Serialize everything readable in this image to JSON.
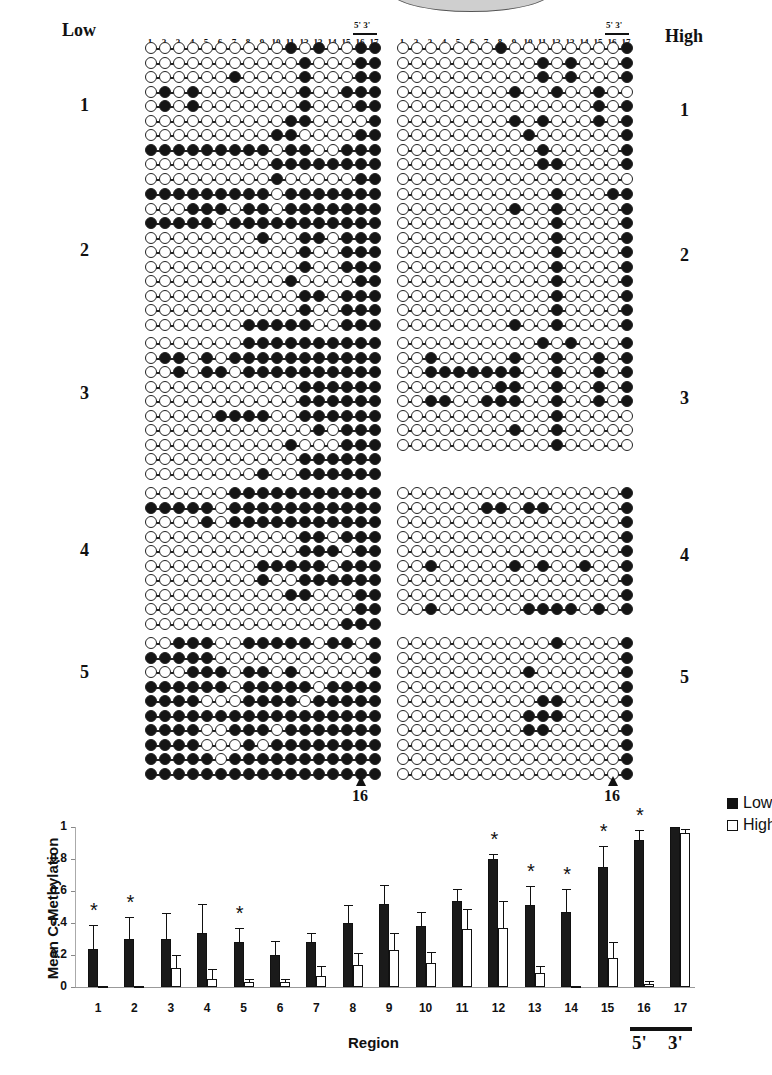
{
  "header": {
    "left_title": "Low",
    "right_title": "High",
    "primer_label": "5'  3'",
    "position_numbers": [
      "1",
      "2",
      "3",
      "4",
      "5",
      "6",
      "7",
      "8",
      "9",
      "10",
      "11",
      "12",
      "13",
      "14",
      "15",
      "16",
      "17"
    ],
    "banner_tail": "es   ng"
  },
  "groups": [
    {
      "label": "1",
      "low": [
        "00000000001010011",
        "00000000000100011",
        "00000010000100011",
        "01010000000100111",
        "01010000000100011",
        "00000000001100001",
        "00000000011000011",
        "11111111101100111",
        "00000000011111111",
        "00000000010000011"
      ],
      "high": [
        "00000001000000001",
        "00000000001010001",
        "00000000001010001",
        "00000000100100100",
        "00000000000000101",
        "00000000101000101",
        "00000000010000001",
        "00000000001000001",
        "00000000001100001",
        "00000000000000000"
      ]
    },
    {
      "label": "2",
      "low": [
        "11111111101111111",
        "00011101101111111",
        "11111011111111111",
        "00000000100110111",
        "00000000000100111",
        "00000000000100111",
        "00000000001000011",
        "00000000000110111",
        "00000000000100111",
        "00000001111100111"
      ],
      "high": [
        "00000000000100011",
        "00000000100100001",
        "00000000000100001",
        "00000000000100001",
        "00000000000100001",
        "00000000000100001",
        "00000000000100001",
        "00000000000100001",
        "00000000000100001",
        "00000000100100001"
      ]
    },
    {
      "label": "3",
      "low": [
        "00000001111111111",
        "01101011111111111",
        "00101101111111111",
        "00000000000111111",
        "00000000000111111",
        "00000111100111111",
        "00000000000010111",
        "00000000001000111",
        "00000000000111111",
        "00000000100111111"
      ],
      "high": [
        "00000000001010001",
        "00100000100100101",
        "00111111100100101",
        "00000001100100101",
        "00110011100100101",
        "00000000000100000",
        "00000000100100000",
        "00000000000100000"
      ]
    },
    {
      "label": "4",
      "low": [
        "00000011111111111",
        "11111011111111111",
        "00001011111111111",
        "00000000000110111",
        "00000000000111011",
        "00000000111110111",
        "00000000100111111",
        "00000000001100011",
        "00000000000000011",
        "00000000000000111"
      ],
      "high": [
        "00000000000000001",
        "00000011011000001",
        "00000000000000001",
        "00000000000000001",
        "00000000000000001",
        "00100000101001001",
        "00000000000000001",
        "00000000000000001",
        "00100000011110101"
      ]
    },
    {
      "label": "5",
      "low": [
        "00111001111101101",
        "11111000000000001",
        "00011101101000001",
        "11111101111101111",
        "11110001111011111",
        "11111111111111111",
        "11110011101111111",
        "11110001011111111",
        "11111011111111111",
        "11111111111111111"
      ],
      "high": [
        "00000000000100001",
        "00000000000000001",
        "00000000010000001",
        "00000000000000001",
        "00000000001100001",
        "00000000011100001",
        "00000000011000001",
        "00000000000000001",
        "00000000000000001",
        "00000000000000001"
      ]
    }
  ],
  "arrows": {
    "left_label": "16",
    "right_label": "16"
  },
  "chart_data": {
    "type": "bar",
    "title": "",
    "xlabel": "Region",
    "ylabel": "Mean C-Methylation",
    "ylim": [
      0,
      1
    ],
    "yticks": [
      "0",
      "0.2",
      "0.4",
      "0.6",
      "0.8",
      "1"
    ],
    "categories": [
      "1",
      "2",
      "3",
      "4",
      "5",
      "6",
      "7",
      "8",
      "9",
      "10",
      "11",
      "12",
      "13",
      "14",
      "15",
      "16",
      "17"
    ],
    "series": [
      {
        "name": "Low",
        "color": "#1a1a1a",
        "values": [
          0.24,
          0.3,
          0.3,
          0.34,
          0.28,
          0.2,
          0.28,
          0.4,
          0.52,
          0.38,
          0.54,
          0.8,
          0.51,
          0.47,
          0.75,
          0.92,
          1.0
        ],
        "error": [
          0.15,
          0.14,
          0.16,
          0.18,
          0.09,
          0.09,
          0.06,
          0.11,
          0.12,
          0.09,
          0.07,
          0.03,
          0.12,
          0.14,
          0.13,
          0.06,
          0.0
        ]
      },
      {
        "name": "High",
        "color": "#ffffff",
        "values": [
          0.0,
          0.0,
          0.12,
          0.05,
          0.03,
          0.03,
          0.07,
          0.14,
          0.23,
          0.15,
          0.36,
          0.37,
          0.09,
          0.0,
          0.18,
          0.02,
          0.96
        ],
        "error": [
          0.0,
          0.0,
          0.08,
          0.06,
          0.02,
          0.02,
          0.06,
          0.07,
          0.11,
          0.07,
          0.13,
          0.17,
          0.04,
          0.0,
          0.1,
          0.02,
          0.03
        ]
      }
    ],
    "significant": [
      "1",
      "2",
      "5",
      "12",
      "13",
      "14",
      "15",
      "16"
    ],
    "significance_marker": "*",
    "legend": {
      "position": "top-right",
      "entries": [
        "Low",
        "High"
      ]
    },
    "grid": false,
    "annotation_bar": {
      "under": [
        "16",
        "17"
      ],
      "labels": [
        "5'",
        "3'"
      ]
    }
  }
}
